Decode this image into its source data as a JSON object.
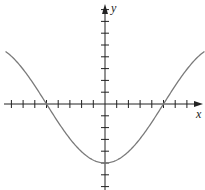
{
  "chart_data": {
    "type": "line",
    "title": "",
    "xlabel": "x",
    "ylabel": "y",
    "xlim": [
      -9,
      8.5
    ],
    "ylim": [
      -7,
      9
    ],
    "x_ticks": [
      -8,
      -7,
      -6,
      -5,
      -4,
      -3,
      -2,
      -1,
      1,
      2,
      3,
      4,
      5,
      6,
      7
    ],
    "y_ticks": [
      -7,
      -6,
      -5,
      -4,
      -3,
      -2,
      -1,
      1,
      2,
      3,
      4,
      5,
      6,
      7,
      8
    ],
    "tick_labels_shown": false,
    "grid": false,
    "series": [
      {
        "name": "y = -5cos(πx/10)",
        "function": "-5*cos(pi*x/10)",
        "x": [
          -8.5,
          -8,
          -7,
          -6,
          -5,
          -4,
          -3,
          -2,
          -1,
          0,
          1,
          2,
          3,
          4,
          5,
          6,
          7,
          8,
          8.5
        ],
        "y": [
          4.46,
          4.05,
          2.94,
          1.55,
          0,
          -1.55,
          -2.94,
          -4.05,
          -4.76,
          -5,
          -4.76,
          -4.05,
          -2.94,
          -1.55,
          0,
          1.55,
          2.94,
          4.05,
          4.46
        ]
      }
    ]
  }
}
